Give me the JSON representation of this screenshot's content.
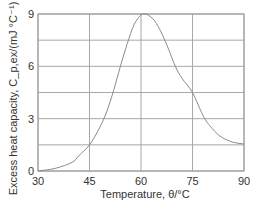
{
  "chart_data": {
    "type": "line",
    "title": "",
    "xlabel": "Temperature, θ/°C",
    "ylabel": "Excess heat capacity, C_p,ex/(mJ °C⁻¹)",
    "xlim": [
      30,
      90
    ],
    "ylim": [
      0,
      9
    ],
    "x_ticks": [
      "30",
      "45",
      "60",
      "75",
      "90"
    ],
    "y_ticks": [
      "0",
      "3",
      "6",
      "9"
    ],
    "grid": true,
    "legend": null,
    "series": [
      {
        "name": "Excess heat capacity",
        "color": "#8a8a8a",
        "x": [
          30,
          35,
          40,
          42,
          45,
          48,
          50,
          52,
          54,
          56,
          58,
          60,
          61,
          62,
          64,
          66,
          68,
          70,
          72,
          75,
          78,
          80,
          83,
          86,
          88,
          90
        ],
        "y": [
          0.0,
          0.15,
          0.5,
          0.9,
          1.5,
          2.5,
          3.4,
          4.6,
          6.0,
          7.3,
          8.4,
          8.95,
          9.0,
          8.95,
          8.6,
          7.9,
          7.0,
          6.0,
          5.3,
          4.5,
          3.2,
          2.6,
          2.0,
          1.7,
          1.6,
          1.55
        ]
      }
    ]
  }
}
